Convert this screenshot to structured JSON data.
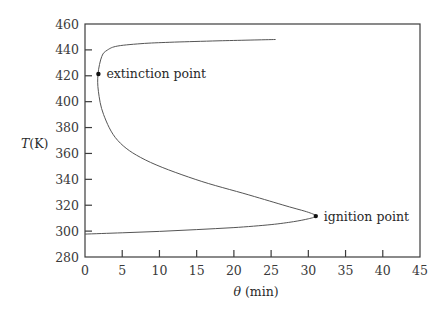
{
  "chart_data": {
    "type": "line",
    "title": "",
    "xlabel": "θ (min)",
    "xlabel_symbol": "θ",
    "xlabel_unit": "(min)",
    "ylabel": "T(K)",
    "ylabel_symbol": "T",
    "ylabel_unit": "(K)",
    "xlim": [
      0,
      45
    ],
    "ylim": [
      280,
      460
    ],
    "xticks": [
      0,
      5,
      10,
      15,
      20,
      25,
      30,
      35,
      40,
      45
    ],
    "yticks": [
      280,
      300,
      320,
      340,
      360,
      380,
      400,
      420,
      440,
      460
    ],
    "grid": false,
    "legend": null,
    "series": [
      {
        "name": "steady-state temperature vs residence time",
        "color": "#555555",
        "x": [
          0,
          5,
          10,
          15,
          20,
          25,
          28,
          30,
          31,
          30,
          27,
          22,
          14.8,
          8.1,
          4.4,
          2.5,
          1.8,
          1.75,
          2.25,
          3.0,
          4.4,
          8,
          12,
          18,
          25.6
        ],
        "y": [
          297.7,
          298.7,
          299.8,
          301.2,
          302.7,
          305,
          307.3,
          309.5,
          311.6,
          314.5,
          319.5,
          328,
          340,
          355,
          370,
          390,
          408,
          421.4,
          435,
          439.8,
          443,
          445,
          446,
          447,
          448
        ]
      }
    ],
    "annotations": [
      {
        "text": "extinction point",
        "x": 1.8,
        "y": 421.4,
        "marker": "dot"
      },
      {
        "text": "ignition point",
        "x": 31.0,
        "y": 311.6,
        "marker": "dot"
      }
    ]
  }
}
